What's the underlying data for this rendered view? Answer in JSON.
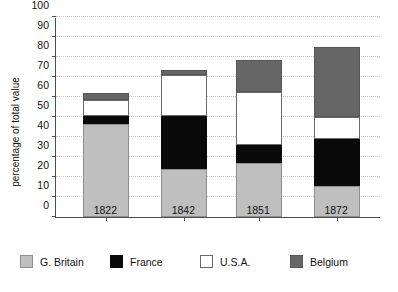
{
  "chart_data": {
    "type": "bar",
    "stacked": true,
    "title": "",
    "subtitle": "",
    "xlabel": "",
    "ylabel": "percentage of total value",
    "ylim": [
      0,
      100
    ],
    "ytick_step": 10,
    "yticks": [
      0,
      10,
      20,
      30,
      40,
      50,
      60,
      70,
      80,
      90,
      100
    ],
    "ytick_labels": [
      "0",
      "10",
      "20",
      "30",
      "40",
      "50",
      "60",
      "70",
      "80",
      "90",
      "100"
    ],
    "categories": [
      "1822",
      "1842",
      "1851",
      "1872"
    ],
    "grid": "horizontal-dotted",
    "legend_position": "bottom",
    "series": [
      {
        "name": "G. Britain",
        "color": "#bfbfbf",
        "values": [
          46.5,
          24.0,
          27.0,
          15.5
        ]
      },
      {
        "name": "France",
        "color": "#0a0a0a",
        "values": [
          4.0,
          26.5,
          9.0,
          23.5
        ]
      },
      {
        "name": "U.S.A.",
        "color": "#ffffff",
        "values": [
          8.0,
          20.5,
          26.5,
          11.0
        ]
      },
      {
        "name": "Belgium",
        "color": "#666666",
        "values": [
          3.5,
          2.5,
          16.0,
          35.0
        ]
      }
    ],
    "totals": [
      62.0,
      73.5,
      78.5,
      85.0
    ]
  },
  "legend": {
    "items": [
      {
        "label": "G. Britain",
        "swatch": "swatch-g-britain"
      },
      {
        "label": "France",
        "swatch": "swatch-france"
      },
      {
        "label": "U.S.A.",
        "swatch": "swatch-usa"
      },
      {
        "label": "Belgium",
        "swatch": "swatch-belgium"
      }
    ]
  }
}
